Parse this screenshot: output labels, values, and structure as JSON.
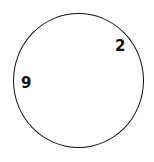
{
  "drawing": {
    "shape": "circle",
    "stroke_color": "#111111",
    "background_color": "#ffffff",
    "numbers": [
      {
        "label": "2"
      },
      {
        "label": "9"
      }
    ]
  }
}
